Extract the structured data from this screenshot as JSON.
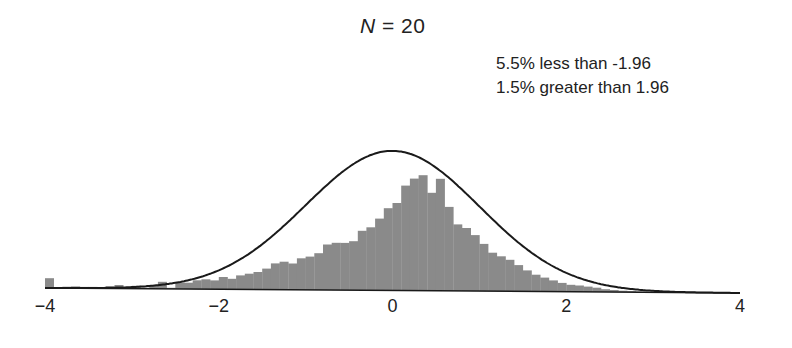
{
  "chart_data": {
    "type": "bar",
    "title": "N = 20",
    "title_var": "N",
    "title_value": "= 20",
    "xlabel": "",
    "ylabel": "",
    "xlim": [
      -4,
      4
    ],
    "bin_width": 0.1,
    "grid": false,
    "x_ticks": [
      "-4",
      "-2",
      "0",
      "2",
      "4"
    ],
    "x_tick_values": [
      -4,
      -2,
      0,
      2,
      4
    ],
    "annotations": [
      "5.5% less than -1.96",
      "1.5% greater than 1.96"
    ],
    "overlay": {
      "type": "line",
      "name": "standard normal density",
      "mean": 0,
      "sd": 1
    },
    "bin_starts": [
      -4.0,
      -3.9,
      -3.8,
      -3.7,
      -3.6,
      -3.5,
      -3.4,
      -3.3,
      -3.2,
      -3.1,
      -3.0,
      -2.9,
      -2.8,
      -2.7,
      -2.6,
      -2.5,
      -2.4,
      -2.3,
      -2.2,
      -2.1,
      -2.0,
      -1.9,
      -1.8,
      -1.7,
      -1.6,
      -1.5,
      -1.4,
      -1.3,
      -1.2,
      -1.1,
      -1.0,
      -0.9,
      -0.8,
      -0.7,
      -0.6,
      -0.5,
      -0.4,
      -0.3,
      -0.2,
      -0.1,
      0.0,
      0.1,
      0.2,
      0.3,
      0.4,
      0.5,
      0.6,
      0.7,
      0.8,
      0.9,
      1.0,
      1.1,
      1.2,
      1.3,
      1.4,
      1.5,
      1.6,
      1.7,
      1.8,
      1.9,
      2.0,
      2.1,
      2.2,
      2.3,
      2.4,
      2.5,
      2.6,
      2.7,
      2.8,
      2.9
    ],
    "values": [
      0.028,
      0.003,
      0.004,
      0.005,
      0.004,
      0.004,
      0.003,
      0.006,
      0.01,
      0.003,
      0.008,
      0.003,
      0.01,
      0.02,
      0.003,
      0.018,
      0.018,
      0.025,
      0.028,
      0.025,
      0.035,
      0.03,
      0.04,
      0.045,
      0.05,
      0.06,
      0.075,
      0.08,
      0.075,
      0.09,
      0.095,
      0.105,
      0.13,
      0.135,
      0.135,
      0.14,
      0.17,
      0.18,
      0.205,
      0.235,
      0.25,
      0.3,
      0.32,
      0.33,
      0.28,
      0.32,
      0.24,
      0.19,
      0.18,
      0.16,
      0.135,
      0.11,
      0.1,
      0.09,
      0.075,
      0.06,
      0.048,
      0.04,
      0.032,
      0.025,
      0.02,
      0.018,
      0.015,
      0.012,
      0.008,
      0.006,
      0.004,
      0.003,
      0.002,
      0.001
    ],
    "colors": {
      "bars": "#8a8a8a",
      "curve": "#1a1a1a",
      "axis": "#1a1a1a",
      "text": "#222222"
    }
  }
}
